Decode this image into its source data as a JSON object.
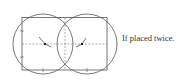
{
  "caption": "If placed twice.",
  "figure": {
    "colors": {
      "stroke": "#555555",
      "dash": "#777777",
      "marker": "#222222"
    }
  }
}
